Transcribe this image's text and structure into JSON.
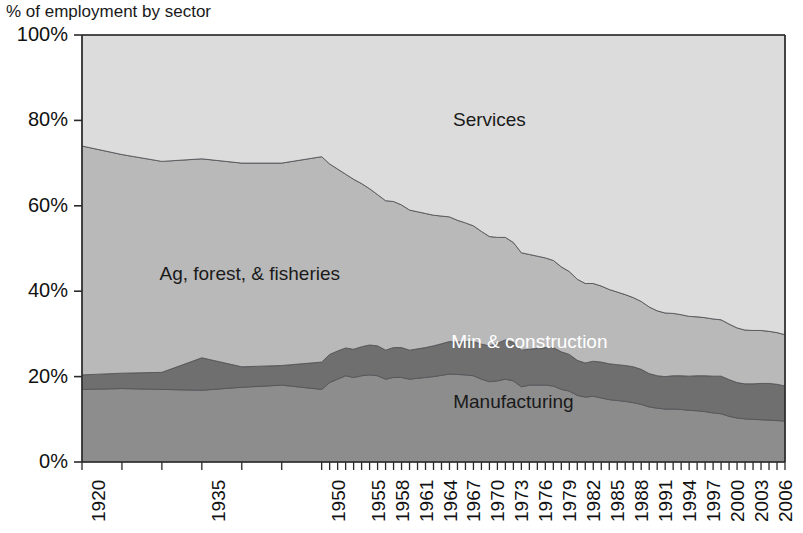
{
  "title": "% of employment by sector",
  "chart_data": {
    "type": "area",
    "title": "% of employment by sector",
    "xlabel": "",
    "ylabel": "",
    "ylim": [
      0,
      100
    ],
    "ytick_labels": [
      "100%",
      "80%",
      "60%",
      "40%",
      "20%",
      "0%"
    ],
    "ytick_values": [
      100,
      80,
      60,
      40,
      20,
      0
    ],
    "grid": false,
    "legend": "in-plot labels",
    "stacked": true,
    "stack_order_bottom_to_top": [
      "Manufacturing",
      "Min & construction",
      "Ag, forest, & fisheries",
      "Services"
    ],
    "categories": [
      1920,
      1925,
      1930,
      1935,
      1940,
      1945,
      1950,
      1951,
      1952,
      1953,
      1954,
      1955,
      1956,
      1957,
      1958,
      1959,
      1960,
      1961,
      1962,
      1963,
      1964,
      1965,
      1966,
      1967,
      1968,
      1969,
      1970,
      1971,
      1972,
      1973,
      1974,
      1975,
      1976,
      1977,
      1978,
      1979,
      1980,
      1981,
      1982,
      1983,
      1984,
      1985,
      1986,
      1987,
      1988,
      1989,
      1990,
      1991,
      1992,
      1993,
      1994,
      1995,
      1996,
      1997,
      1998,
      1999,
      2000,
      2001,
      2002,
      2003,
      2004,
      2005,
      2006,
      2007,
      2008
    ],
    "xtick_labels": [
      "1920",
      "1935",
      "1950",
      "1955",
      "1958",
      "1961",
      "1964",
      "1967",
      "1970",
      "1973",
      "1976",
      "1979",
      "1982",
      "1985",
      "1988",
      "1991",
      "1994",
      "1997",
      "2000",
      "2003",
      "2006"
    ],
    "xtick_positions": [
      1920,
      1935,
      1950,
      1955,
      1958,
      1961,
      1964,
      1967,
      1970,
      1973,
      1976,
      1979,
      1982,
      1985,
      1988,
      1991,
      1994,
      1997,
      2000,
      2003,
      2006
    ],
    "series": [
      {
        "name": "Manufacturing",
        "color": "#8d8d8d",
        "label_color": "#1a1a1a",
        "values": [
          17.0,
          17.2,
          17.0,
          16.8,
          17.5,
          18.0,
          17.0,
          18.6,
          19.4,
          20.2,
          19.8,
          20.2,
          20.4,
          20.2,
          19.4,
          19.8,
          19.8,
          19.4,
          19.6,
          19.8,
          20.0,
          20.3,
          20.6,
          20.5,
          20.4,
          20.2,
          19.4,
          18.8,
          19.0,
          19.4,
          19.0,
          17.6,
          18.0,
          18.0,
          18.0,
          17.8,
          17.0,
          16.6,
          15.6,
          15.2,
          15.4,
          15.0,
          14.6,
          14.4,
          14.2,
          13.9,
          13.5,
          12.9,
          12.6,
          12.4,
          12.4,
          12.3,
          12.1,
          12.0,
          11.8,
          11.5,
          11.3,
          10.7,
          10.3,
          10.1,
          10.0,
          9.9,
          9.8,
          9.7,
          9.6
        ]
      },
      {
        "name": "Min & construction",
        "color": "#6f6f6f",
        "label_color": "#ffffff",
        "values": [
          3.4,
          3.6,
          4.0,
          7.6,
          4.8,
          4.6,
          6.4,
          6.6,
          6.6,
          6.5,
          6.6,
          6.8,
          7.0,
          7.0,
          6.8,
          7.0,
          7.0,
          6.8,
          6.9,
          7.0,
          7.2,
          7.4,
          7.6,
          7.6,
          7.8,
          8.0,
          8.2,
          8.4,
          8.8,
          9.2,
          9.0,
          8.6,
          8.4,
          8.6,
          8.8,
          9.0,
          8.8,
          8.6,
          8.2,
          8.0,
          8.2,
          8.4,
          8.4,
          8.4,
          8.4,
          8.4,
          8.2,
          7.8,
          7.6,
          7.6,
          7.8,
          7.9,
          8.0,
          8.2,
          8.4,
          8.6,
          8.8,
          8.6,
          8.3,
          8.2,
          8.3,
          8.5,
          8.6,
          8.5,
          8.2
        ]
      },
      {
        "name": "Ag, forest, & fisheries",
        "color": "#b9b9b9",
        "label_color": "#1a1a1a",
        "values": [
          53.6,
          51.2,
          49.4,
          46.6,
          47.7,
          47.4,
          48.1,
          44.6,
          42.6,
          40.7,
          39.8,
          38.2,
          36.6,
          35.4,
          35.0,
          34.2,
          33.4,
          32.8,
          32.1,
          31.4,
          30.6,
          29.9,
          29.2,
          28.5,
          27.8,
          27.1,
          26.4,
          25.6,
          24.8,
          24.0,
          23.4,
          22.8,
          22.2,
          21.6,
          21.0,
          20.4,
          19.9,
          19.4,
          19.0,
          18.6,
          18.2,
          17.8,
          17.4,
          17.0,
          16.6,
          16.2,
          15.9,
          15.6,
          15.2,
          14.9,
          14.6,
          14.3,
          14.0,
          13.8,
          13.6,
          13.4,
          13.2,
          13.0,
          12.8,
          12.6,
          12.5,
          12.4,
          12.2,
          12.1,
          12.0
        ]
      },
      {
        "name": "Services",
        "color": "#dcdcdc",
        "label_color": "#1a1a1a",
        "values": [
          26.0,
          28.0,
          29.6,
          29.0,
          30.0,
          30.0,
          28.5,
          30.2,
          31.4,
          32.6,
          33.8,
          34.8,
          36.0,
          37.4,
          38.8,
          39.0,
          39.8,
          41.0,
          41.4,
          41.8,
          42.2,
          42.4,
          42.6,
          43.4,
          44.0,
          44.7,
          46.0,
          47.2,
          47.4,
          47.4,
          48.6,
          51.0,
          51.4,
          51.8,
          52.2,
          52.8,
          54.3,
          55.4,
          57.2,
          58.2,
          58.2,
          58.8,
          59.6,
          60.2,
          60.8,
          61.5,
          62.4,
          63.7,
          64.6,
          65.1,
          65.2,
          65.5,
          65.9,
          66.0,
          66.2,
          66.5,
          66.7,
          67.7,
          68.6,
          69.1,
          69.2,
          69.2,
          69.4,
          69.7,
          70.2
        ]
      }
    ],
    "annotations": [
      {
        "text": "Services",
        "x": 1971,
        "y": 80,
        "color": "#1a1a1a"
      },
      {
        "text": "Ag, forest, & fisheries",
        "x": 1941,
        "y": 44,
        "color": "#1a1a1a"
      },
      {
        "text": "Min & construction",
        "x": 1976,
        "y": 28,
        "color": "#ffffff"
      },
      {
        "text": "Manufacturing",
        "x": 1974,
        "y": 14,
        "color": "#1a1a1a"
      }
    ]
  }
}
